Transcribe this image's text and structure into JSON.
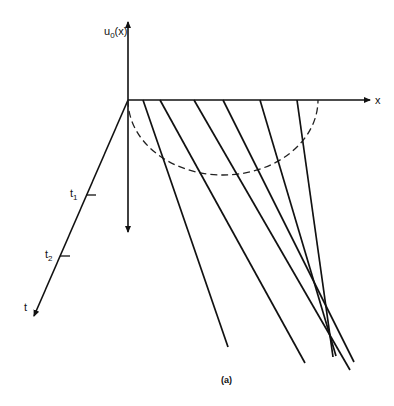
{
  "figure": {
    "caption": "(a)",
    "y_axis_label": "u",
    "y_axis_sub": "0",
    "y_axis_suffix": "(x)",
    "x_axis_label": "x",
    "t_axis_label": "t",
    "ticks": [
      {
        "label": "t",
        "sub": "1"
      },
      {
        "label": "t",
        "sub": "2"
      }
    ],
    "characteristics": [
      {
        "x0": 143,
        "y0": 100,
        "x1": 228,
        "y1": 347
      },
      {
        "x0": 160,
        "y0": 100,
        "x1": 305,
        "y1": 363
      },
      {
        "x0": 194,
        "y0": 100,
        "x1": 350,
        "y1": 370
      },
      {
        "x0": 223,
        "y0": 100,
        "x1": 354,
        "y1": 362
      },
      {
        "x0": 260,
        "y0": 100,
        "x1": 336,
        "y1": 356
      },
      {
        "x0": 297,
        "y0": 100,
        "x1": 333,
        "y1": 357
      }
    ],
    "initial_profile": "dashed semicircle"
  }
}
